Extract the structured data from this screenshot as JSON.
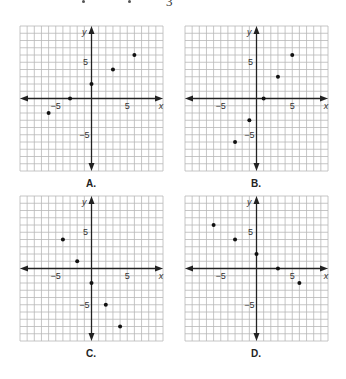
{
  "header": {
    "fragment_text": "3"
  },
  "axes": {
    "x_label": "x",
    "y_label": "y",
    "tick_pos": "5",
    "tick_neg": "−5",
    "range": [
      -10,
      10
    ],
    "grid_step": 1
  },
  "colors": {
    "grid": "#b8b8b8",
    "axis": "#222222",
    "point": "#111111"
  },
  "chart_data": [
    {
      "type": "scatter",
      "title": "A.",
      "xlabel": "x",
      "ylabel": "y",
      "xlim": [
        -10,
        10
      ],
      "ylim": [
        -10,
        10
      ],
      "grid": true,
      "x": [
        -6,
        -3,
        0,
        3,
        6
      ],
      "y": [
        -2,
        0,
        2,
        4,
        6
      ]
    },
    {
      "type": "scatter",
      "title": "B.",
      "xlabel": "x",
      "ylabel": "y",
      "xlim": [
        -10,
        10
      ],
      "ylim": [
        -10,
        10
      ],
      "grid": true,
      "x": [
        -3,
        -1,
        1,
        3,
        5
      ],
      "y": [
        -6,
        -3,
        0,
        3,
        6
      ]
    },
    {
      "type": "scatter",
      "title": "C.",
      "xlabel": "x",
      "ylabel": "y",
      "xlim": [
        -10,
        10
      ],
      "ylim": [
        -10,
        10
      ],
      "grid": true,
      "x": [
        -4,
        -2,
        0,
        2,
        4
      ],
      "y": [
        4,
        1,
        -2,
        -5,
        -8
      ]
    },
    {
      "type": "scatter",
      "title": "D.",
      "xlabel": "x",
      "ylabel": "y",
      "xlim": [
        -10,
        10
      ],
      "ylim": [
        -10,
        10
      ],
      "grid": true,
      "x": [
        -6,
        -3,
        0,
        3,
        6
      ],
      "y": [
        6,
        4,
        2,
        0,
        -2
      ]
    }
  ]
}
